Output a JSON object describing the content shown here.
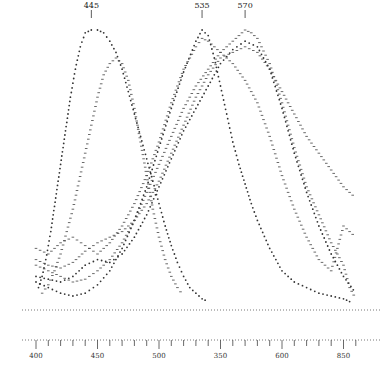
{
  "chart_data": {
    "type": "scatter",
    "title": "",
    "xlabel": "",
    "ylabel": "",
    "xlim": [
      396,
      662
    ],
    "ylim": [
      0,
      100
    ],
    "grid": false,
    "legend": null,
    "x_ticks": [
      400,
      450,
      500,
      550,
      600,
      650
    ],
    "x_tick_labels": [
      "400",
      "450",
      "500",
      "350",
      "600",
      "850"
    ],
    "peak_annotations": [
      {
        "label": "445",
        "x": 445
      },
      {
        "label": "535",
        "x": 535
      },
      {
        "label": "570",
        "x": 570
      }
    ],
    "baseline": {
      "style": "dotted",
      "y": 0
    },
    "series": [
      {
        "name": "curve-445",
        "marker": "dot",
        "x": [
          402,
          405,
          408,
          412,
          416,
          420,
          424,
          428,
          432,
          436,
          440,
          445,
          450,
          455,
          460,
          465,
          470,
          475,
          480,
          485,
          490,
          495,
          500,
          505,
          510,
          515,
          520,
          525,
          530,
          535,
          540
        ],
        "y": [
          8,
          12,
          18,
          28,
          40,
          52,
          64,
          76,
          86,
          94,
          99,
          100,
          100,
          99,
          96,
          92,
          86,
          78,
          70,
          62,
          54,
          46,
          38,
          30,
          23,
          17,
          12,
          8,
          6,
          4,
          3
        ]
      },
      {
        "name": "curve-455",
        "marker": "dash",
        "x": [
          405,
          410,
          415,
          420,
          425,
          430,
          435,
          440,
          445,
          450,
          455,
          460,
          465,
          470,
          475,
          480,
          485,
          490,
          495,
          500,
          505,
          510,
          515,
          520
        ],
        "y": [
          6,
          9,
          14,
          20,
          28,
          36,
          46,
          56,
          66,
          76,
          84,
          88,
          90,
          88,
          82,
          72,
          60,
          48,
          36,
          26,
          18,
          12,
          8,
          5
        ]
      },
      {
        "name": "curve-535a",
        "marker": "dot",
        "x": [
          400,
          410,
          420,
          430,
          440,
          450,
          460,
          470,
          480,
          490,
          500,
          510,
          520,
          530,
          535,
          540,
          545,
          550,
          555,
          560,
          565,
          570,
          575,
          580,
          590,
          600,
          610,
          620,
          630,
          640,
          650,
          655,
          660
        ],
        "y": [
          10,
          8,
          6,
          5,
          6,
          9,
          14,
          22,
          32,
          44,
          58,
          72,
          85,
          96,
          100,
          98,
          90,
          80,
          70,
          60,
          52,
          45,
          38,
          32,
          22,
          14,
          10,
          8,
          6,
          5,
          4,
          3,
          3
        ]
      },
      {
        "name": "curve-535b",
        "marker": "dash",
        "x": [
          400,
          410,
          420,
          430,
          440,
          450,
          460,
          470,
          480,
          490,
          500,
          510,
          520,
          530,
          535,
          540,
          550,
          560,
          570,
          580,
          590,
          600,
          610,
          620,
          630,
          640,
          650,
          660
        ],
        "y": [
          22,
          20,
          24,
          26,
          23,
          20,
          24,
          30,
          38,
          48,
          60,
          74,
          86,
          94,
          97,
          96,
          92,
          88,
          82,
          74,
          62,
          48,
          36,
          26,
          18,
          14,
          30,
          26
        ]
      },
      {
        "name": "curve-570a",
        "marker": "dash",
        "x": [
          400,
          410,
          420,
          430,
          440,
          450,
          460,
          470,
          480,
          490,
          500,
          510,
          520,
          530,
          540,
          550,
          560,
          570,
          575,
          580,
          590,
          600,
          610,
          620,
          630,
          640,
          650,
          655,
          660
        ],
        "y": [
          16,
          14,
          12,
          10,
          11,
          14,
          18,
          24,
          32,
          42,
          52,
          62,
          72,
          80,
          86,
          92,
          96,
          100,
          99,
          97,
          88,
          74,
          58,
          44,
          34,
          24,
          16,
          8,
          4
        ]
      },
      {
        "name": "curve-570b",
        "marker": "dot",
        "x": [
          400,
          410,
          420,
          430,
          440,
          450,
          460,
          470,
          480,
          490,
          500,
          510,
          520,
          530,
          540,
          550,
          560,
          570,
          580,
          590,
          600,
          610,
          620,
          630,
          640,
          650,
          660
        ],
        "y": [
          12,
          11,
          10,
          12,
          16,
          18,
          17,
          20,
          26,
          34,
          44,
          54,
          64,
          72,
          80,
          88,
          93,
          96,
          94,
          86,
          72,
          56,
          42,
          30,
          20,
          12,
          6
        ]
      },
      {
        "name": "curve-570c",
        "marker": "dash",
        "x": [
          400,
          410,
          420,
          430,
          440,
          450,
          460,
          470,
          480,
          490,
          500,
          510,
          520,
          530,
          540,
          550,
          560,
          570,
          580,
          590,
          600,
          610,
          620,
          630,
          640,
          650,
          660
        ],
        "y": [
          18,
          16,
          15,
          17,
          21,
          24,
          26,
          28,
          32,
          38,
          46,
          56,
          66,
          76,
          84,
          90,
          92,
          94,
          92,
          86,
          78,
          70,
          62,
          56,
          50,
          44,
          40
        ]
      }
    ]
  }
}
